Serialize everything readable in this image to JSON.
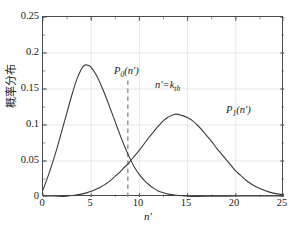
{
  "chart_data": {
    "type": "line",
    "title": "",
    "xlabel": "n'",
    "ylabel": "概率分布",
    "xlim": [
      0,
      25
    ],
    "ylim": [
      0,
      0.25
    ],
    "grid": true,
    "legend_position": "inline-annotations",
    "xticks": [
      "0",
      "5",
      "10",
      "15",
      "20",
      "25"
    ],
    "xtick_values": [
      0,
      5,
      10,
      15,
      20,
      25
    ],
    "yticks": [
      "0",
      "0.05",
      "0.1",
      "0.15",
      "0.2",
      "0.25"
    ],
    "ytick_values": [
      0,
      0.05,
      0.1,
      0.15,
      0.2,
      0.25
    ],
    "series": [
      {
        "name": "P0(n')",
        "label_text": "P",
        "label_sub": "0",
        "label_arg": "(n')",
        "color": "#3a3a3a",
        "peak_x": 4.3,
        "peak_y": 0.183,
        "x": [
          0,
          0.5,
          1,
          1.5,
          2,
          2.5,
          3,
          3.5,
          4,
          4.3,
          4.7,
          5,
          5.5,
          6,
          6.5,
          7,
          7.5,
          8,
          8.5,
          9,
          9.5,
          10,
          10.5,
          11,
          11.5,
          12,
          12.5,
          13,
          14,
          15,
          16,
          17,
          18,
          20,
          22,
          25
        ],
        "y": [
          0.01,
          0.028,
          0.048,
          0.07,
          0.094,
          0.118,
          0.142,
          0.163,
          0.178,
          0.183,
          0.183,
          0.18,
          0.17,
          0.156,
          0.14,
          0.122,
          0.104,
          0.086,
          0.069,
          0.054,
          0.041,
          0.031,
          0.023,
          0.017,
          0.012,
          0.008,
          0.006,
          0.004,
          0.002,
          0.001,
          0.0005,
          0.0003,
          0.0002,
          0.0001,
          0.0,
          0.0
        ]
      },
      {
        "name": "P1(n')",
        "label_text": "P",
        "label_sub": "1",
        "label_arg": "(n')",
        "color": "#3a3a3a",
        "peak_x": 13.7,
        "peak_y": 0.115,
        "x": [
          0,
          1,
          2,
          3,
          4,
          5,
          6,
          6.5,
          7,
          7.5,
          8,
          8.5,
          8.8,
          9,
          9.5,
          10,
          10.5,
          11,
          11.5,
          12,
          12.5,
          13,
          13.7,
          14.5,
          15,
          15.5,
          16,
          16.5,
          17,
          17.5,
          18,
          18.5,
          19,
          19.5,
          20,
          20.5,
          21,
          21.5,
          22,
          23,
          24,
          25
        ],
        "y": [
          0.0,
          0.0,
          0.0005,
          0.002,
          0.004,
          0.008,
          0.014,
          0.018,
          0.023,
          0.029,
          0.035,
          0.042,
          0.0455,
          0.049,
          0.057,
          0.065,
          0.074,
          0.083,
          0.091,
          0.099,
          0.106,
          0.111,
          0.115,
          0.113,
          0.11,
          0.106,
          0.1,
          0.093,
          0.085,
          0.077,
          0.068,
          0.06,
          0.052,
          0.044,
          0.036,
          0.03,
          0.024,
          0.019,
          0.015,
          0.009,
          0.005,
          0.003
        ]
      }
    ],
    "annotations": [
      {
        "id": "threshold-line",
        "type": "vline",
        "x": 8.8,
        "y_top": 0.167,
        "style": "dashed",
        "color": "#8a8a8a",
        "label": "n'=k",
        "label_sub": "th"
      }
    ]
  },
  "axes": {
    "ylabel": "概率分布",
    "xlabel": "n'"
  },
  "labels": {
    "p0_base": "P",
    "p0_sub": "0",
    "p0_tail": "(n′)",
    "p1_base": "P",
    "p1_sub": "1",
    "p1_tail": "(n′)",
    "threshold_base": "n′=k",
    "threshold_sub": "th"
  },
  "colors": {
    "curve": "#3a3a3a",
    "threshold": "#8a8a8a",
    "grid": "#d8d8d8",
    "frame": "#4a4a4a",
    "background": "#ffffff"
  }
}
